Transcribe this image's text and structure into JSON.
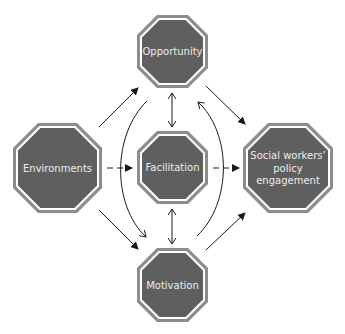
{
  "diagram": {
    "type": "conceptual-model",
    "colors": {
      "node_outer": "#8c8c8c",
      "node_gap": "#ffffff",
      "node_fill": "#5f5f5f",
      "node_text": "#ececec",
      "edge": "#1a1a1a"
    },
    "nodes": [
      {
        "id": "opportunity",
        "label_lines": [
          "Opportunity"
        ]
      },
      {
        "id": "environments",
        "label_lines": [
          "Environments"
        ]
      },
      {
        "id": "facilitation",
        "label_lines": [
          "Facilitation"
        ]
      },
      {
        "id": "social",
        "label_lines": [
          "Social workers’",
          "policy",
          "engagement"
        ]
      },
      {
        "id": "motivation",
        "label_lines": [
          "Motivation"
        ]
      }
    ],
    "edges": [
      {
        "from": "environments",
        "to": "opportunity",
        "style": "solid",
        "direction": "forward"
      },
      {
        "from": "environments",
        "to": "facilitation",
        "style": "dashed",
        "direction": "forward"
      },
      {
        "from": "environments",
        "to": "motivation",
        "style": "solid",
        "direction": "forward"
      },
      {
        "from": "opportunity",
        "to": "facilitation",
        "style": "solid",
        "direction": "both"
      },
      {
        "from": "facilitation",
        "to": "motivation",
        "style": "solid",
        "direction": "both"
      },
      {
        "from": "opportunity",
        "to": "social",
        "style": "solid",
        "direction": "forward"
      },
      {
        "from": "facilitation",
        "to": "social",
        "style": "dashed",
        "direction": "forward"
      },
      {
        "from": "motivation",
        "to": "social",
        "style": "solid",
        "direction": "forward"
      },
      {
        "from": "opportunity",
        "to": "motivation",
        "style": "curved",
        "direction": "forward"
      },
      {
        "from": "motivation",
        "to": "opportunity",
        "style": "curved",
        "direction": "forward"
      }
    ]
  }
}
